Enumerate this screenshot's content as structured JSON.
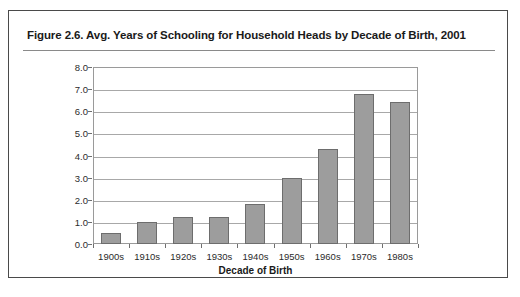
{
  "figure": {
    "title": "Figure 2.6.  Avg. Years of Schooling for Household Heads by Decade of Birth, 2001"
  },
  "chart_data": {
    "type": "bar",
    "title": "Figure 2.6.  Avg. Years of Schooling for Household Heads by Decade of Birth, 2001",
    "categories": [
      "1900s",
      "1910s",
      "1920s",
      "1930s",
      "1940s",
      "1950s",
      "1960s",
      "1970s",
      "1980s"
    ],
    "values": [
      0.5,
      1.0,
      1.2,
      1.2,
      1.8,
      3.0,
      4.3,
      6.8,
      6.4
    ],
    "xlabel": "Decade of Birth",
    "ylabel": "",
    "ylim": [
      0.0,
      8.0
    ],
    "ytick_labels": [
      "0.0",
      "1.0",
      "2.0",
      "3.0",
      "4.0",
      "5.0",
      "6.0",
      "7.0",
      "8.0"
    ],
    "ytick_values": [
      0.0,
      1.0,
      2.0,
      3.0,
      4.0,
      5.0,
      6.0,
      7.0,
      8.0
    ],
    "grid": true,
    "legend": false,
    "bar_color": "#9d9d9d",
    "bar_border_color": "#6d6d6d"
  }
}
